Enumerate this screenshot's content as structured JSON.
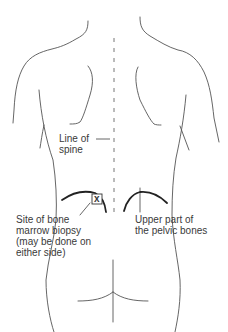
{
  "diagram": {
    "line_color": "#555555",
    "bold_line_color": "#222222",
    "labels": {
      "spine": {
        "lines": [
          "Line of",
          "spine"
        ]
      },
      "biopsy_site": {
        "lines": [
          "Site of bone",
          "marrow biopsy",
          "(may be done on",
          "either side)"
        ]
      },
      "pelvic": {
        "lines": [
          "Upper part of",
          "the pelvic bones"
        ]
      },
      "marker": "x"
    }
  }
}
